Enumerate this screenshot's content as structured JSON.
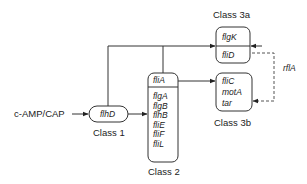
{
  "diagram": {
    "type": "gene regulatory hierarchy",
    "input": {
      "label": "c-AMP/CAP"
    },
    "class1": {
      "title": "Class 1",
      "genes": [
        "flhD"
      ]
    },
    "class2": {
      "title": "Class 2",
      "top_gene": "fliA",
      "genes": [
        "flgA",
        "flgB",
        "flhB",
        "fliE",
        "fliF",
        "fliL"
      ]
    },
    "class3a": {
      "title": "Class 3a",
      "genes": [
        "flgK",
        "fliD"
      ]
    },
    "class3b": {
      "title": "Class 3b",
      "genes": [
        "fliC",
        "motA",
        "tar"
      ]
    },
    "feedback": {
      "label": "rflA",
      "style": "dashed"
    },
    "colors": {
      "line": "#333333",
      "box_border": "#333333",
      "dashed": "#555555",
      "background": "#ffffff"
    },
    "edges": [
      {
        "from": "c-AMP/CAP",
        "to": "flhD"
      },
      {
        "from": "flhD",
        "to": "Class 2"
      },
      {
        "from": "flhD",
        "to": "Class 3a"
      },
      {
        "from": "fliA",
        "to": "Class 3a"
      },
      {
        "from": "fliA",
        "to": "Class 3b"
      },
      {
        "from": "fliD",
        "to": "Class 3a",
        "style": "dashed",
        "label": "rflA"
      },
      {
        "from": "fliD",
        "to": "Class 3b",
        "style": "dashed",
        "label": "rflA"
      }
    ]
  }
}
